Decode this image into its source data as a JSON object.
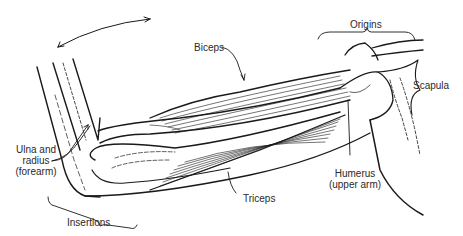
{
  "diagram": {
    "labels": {
      "biceps": "Biceps",
      "origins": "Origins",
      "scapula": "Scapula",
      "ulna_line1": "Ulna and",
      "ulna_line2": "radius",
      "ulna_line3": "(forearm)",
      "humerus_line1": "Humerus",
      "humerus_line2": "(upper arm)",
      "triceps": "Triceps",
      "insertions": "Insertions"
    },
    "colors": {
      "ink": "#1a1a1a",
      "background": "#ffffff"
    }
  }
}
